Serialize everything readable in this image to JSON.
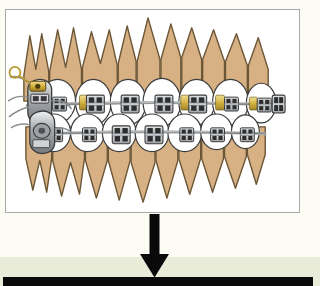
{
  "slide": {
    "background_color": "#fcfcf5",
    "lower_band_color": "#e9ecd9",
    "bottom_bar_color": "#0a0a0a",
    "title": "",
    "caption": ""
  },
  "image_panel": {
    "border_color": "#a9a9a9",
    "background_color": "#ffffff",
    "alt_label": "Lateral view of upper and lower dental arches with fixed orthodontic appliance",
    "illustration": {
      "name": "orthodontic-braces-lateral-view",
      "tooth_color": "#d7b184",
      "tooth_outline_color": "#6b5636",
      "enamel_color": "#ffffff",
      "bracket_color": "#b9bcbf",
      "bracket_dark_color": "#2b2b2b",
      "archwire_color": "#8a8d90",
      "ligature_gold_color": "#d6b43c",
      "upper_arch_teeth": 9,
      "lower_arch_teeth": 9,
      "upper_brackets": 7,
      "lower_brackets": 7,
      "molar_band_side": "left",
      "has_headgear_tube": true,
      "has_hook": true
    }
  },
  "arrow": {
    "name": "down-arrow",
    "direction": "down",
    "color": "#0a0a0a",
    "shaft_width_px": 10,
    "head_width_px": 29,
    "total_height_px": 64
  }
}
